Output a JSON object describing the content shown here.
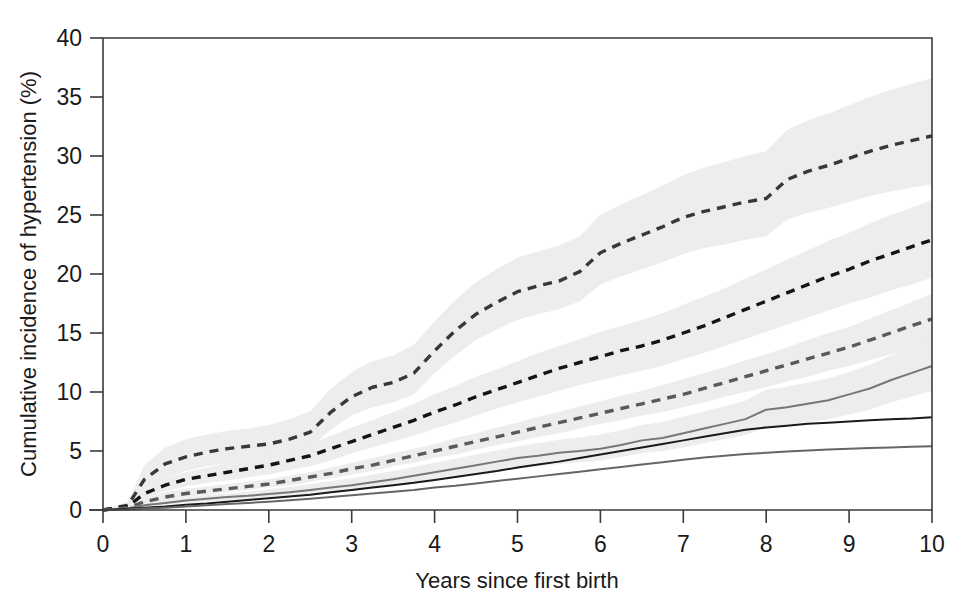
{
  "chart_data": {
    "type": "line",
    "title": "",
    "xlabel": "Years since first birth",
    "ylabel": "Cumulative incidence of hypertension (%)",
    "xlim": [
      0,
      10
    ],
    "ylim": [
      0,
      40
    ],
    "xticks": [
      0,
      1,
      2,
      3,
      4,
      5,
      6,
      7,
      8,
      9,
      10
    ],
    "xtick_labels": [
      "0",
      "1",
      "2",
      "3",
      "4",
      "5",
      "6",
      "7",
      "8",
      "9",
      "10"
    ],
    "yticks": [
      0,
      5,
      10,
      15,
      20,
      25,
      30,
      35,
      40
    ],
    "ytick_labels": [
      "0",
      "5",
      "10",
      "15",
      "20",
      "25",
      "30",
      "35",
      "40"
    ],
    "grid": false,
    "legend": "none",
    "band_color": "#ededed",
    "x": [
      0.0,
      0.3,
      0.5,
      0.75,
      1.0,
      1.25,
      1.5,
      1.75,
      2.0,
      2.25,
      2.5,
      2.75,
      3.0,
      3.25,
      3.5,
      3.75,
      4.0,
      4.25,
      4.5,
      4.75,
      5.0,
      5.25,
      5.5,
      5.75,
      6.0,
      6.25,
      6.5,
      6.75,
      7.0,
      7.25,
      7.5,
      7.75,
      8.0,
      8.25,
      8.5,
      8.75,
      9.0,
      9.25,
      9.5,
      9.75,
      10.0
    ],
    "series": [
      {
        "name": "curve-1-top-dashed",
        "style": "dashed",
        "color": "#383838",
        "values": [
          0.0,
          0.4,
          2.6,
          3.9,
          4.5,
          4.9,
          5.2,
          5.4,
          5.6,
          6.0,
          6.6,
          8.3,
          9.6,
          10.4,
          10.8,
          11.6,
          13.5,
          15.2,
          16.6,
          17.6,
          18.5,
          19.0,
          19.4,
          20.2,
          21.8,
          22.6,
          23.3,
          24.0,
          24.8,
          25.3,
          25.7,
          26.1,
          26.4,
          28.0,
          28.7,
          29.2,
          29.8,
          30.4,
          30.9,
          31.3,
          31.7
        ],
        "band_low": [
          0.0,
          0.2,
          1.6,
          2.7,
          3.3,
          3.7,
          4.0,
          4.2,
          4.4,
          4.8,
          5.3,
          6.8,
          8.0,
          8.7,
          9.1,
          9.8,
          11.6,
          13.1,
          14.4,
          15.3,
          16.1,
          16.6,
          17.0,
          17.7,
          19.1,
          19.8,
          20.4,
          21.0,
          21.7,
          22.2,
          22.5,
          22.9,
          23.2,
          24.6,
          25.2,
          25.6,
          26.1,
          26.6,
          27.0,
          27.3,
          27.6
        ],
        "band_high": [
          0.0,
          0.7,
          3.8,
          5.3,
          6.0,
          6.4,
          6.7,
          6.9,
          7.2,
          7.7,
          8.4,
          10.3,
          11.7,
          12.6,
          13.1,
          14.0,
          16.0,
          17.8,
          19.3,
          20.4,
          21.4,
          21.9,
          22.4,
          23.2,
          25.0,
          25.9,
          26.7,
          27.5,
          28.4,
          29.0,
          29.5,
          30.0,
          30.4,
          32.2,
          33.0,
          33.6,
          34.3,
          35.0,
          35.6,
          36.1,
          36.6
        ]
      },
      {
        "name": "curve-2-middle-dashed",
        "style": "dashed",
        "color": "#141414",
        "values": [
          0.0,
          0.3,
          1.4,
          2.1,
          2.6,
          2.9,
          3.2,
          3.5,
          3.8,
          4.2,
          4.6,
          5.2,
          5.8,
          6.4,
          7.0,
          7.6,
          8.3,
          8.9,
          9.6,
          10.2,
          10.8,
          11.4,
          12.0,
          12.5,
          13.0,
          13.5,
          13.9,
          14.4,
          15.0,
          15.6,
          16.3,
          17.0,
          17.7,
          18.4,
          19.1,
          19.8,
          20.4,
          21.1,
          21.7,
          22.3,
          22.9
        ],
        "band_low": [
          0.0,
          0.2,
          1.0,
          1.6,
          2.0,
          2.3,
          2.5,
          2.8,
          3.0,
          3.4,
          3.7,
          4.2,
          4.8,
          5.3,
          5.8,
          6.3,
          6.9,
          7.4,
          8.0,
          8.6,
          9.1,
          9.6,
          10.1,
          10.6,
          11.0,
          11.4,
          11.8,
          12.2,
          12.8,
          13.3,
          13.9,
          14.5,
          15.1,
          15.7,
          16.3,
          16.9,
          17.5,
          18.0,
          18.6,
          19.1,
          19.7
        ],
        "band_high": [
          0.0,
          0.5,
          1.9,
          2.7,
          3.2,
          3.6,
          4.0,
          4.3,
          4.7,
          5.1,
          5.6,
          6.3,
          7.0,
          7.6,
          8.3,
          9.0,
          9.8,
          10.5,
          11.3,
          11.9,
          12.6,
          13.3,
          13.9,
          14.5,
          15.1,
          15.6,
          16.1,
          16.7,
          17.4,
          18.1,
          18.8,
          19.6,
          20.4,
          21.2,
          22.0,
          22.8,
          23.5,
          24.3,
          25.0,
          25.6,
          26.3
        ]
      },
      {
        "name": "curve-3-lower-dashed",
        "style": "dashed",
        "color": "#5a5a5a",
        "values": [
          0.0,
          0.2,
          0.7,
          1.1,
          1.4,
          1.6,
          1.8,
          2.0,
          2.2,
          2.5,
          2.8,
          3.1,
          3.5,
          3.8,
          4.2,
          4.6,
          5.0,
          5.4,
          5.8,
          6.2,
          6.6,
          7.0,
          7.4,
          7.8,
          8.2,
          8.6,
          9.0,
          9.4,
          9.8,
          10.3,
          10.8,
          11.3,
          11.8,
          12.3,
          12.8,
          13.3,
          13.8,
          14.4,
          15.0,
          15.6,
          16.2
        ],
        "band_low": [
          0.0,
          0.1,
          0.5,
          0.8,
          1.1,
          1.3,
          1.5,
          1.7,
          1.9,
          2.1,
          2.4,
          2.7,
          3.0,
          3.3,
          3.7,
          4.0,
          4.4,
          4.7,
          5.1,
          5.5,
          5.8,
          6.2,
          6.5,
          6.9,
          7.3,
          7.6,
          8.0,
          8.3,
          8.7,
          9.1,
          9.6,
          10.0,
          10.4,
          10.9,
          11.3,
          11.8,
          12.2,
          12.7,
          13.2,
          13.7,
          14.2
        ],
        "band_high": [
          0.0,
          0.4,
          1.0,
          1.5,
          1.8,
          2.0,
          2.2,
          2.4,
          2.6,
          2.9,
          3.2,
          3.6,
          4.0,
          4.4,
          4.8,
          5.2,
          5.6,
          6.1,
          6.5,
          7.0,
          7.4,
          7.9,
          8.3,
          8.8,
          9.2,
          9.7,
          10.1,
          10.6,
          11.1,
          11.6,
          12.1,
          12.7,
          13.2,
          13.8,
          14.4,
          15.0,
          15.5,
          16.2,
          16.9,
          17.6,
          18.3
        ]
      },
      {
        "name": "curve-4-gray-solid",
        "style": "solid",
        "color": "#777777",
        "values": [
          0.0,
          0.15,
          0.4,
          0.6,
          0.8,
          0.95,
          1.1,
          1.2,
          1.35,
          1.5,
          1.7,
          1.9,
          2.1,
          2.35,
          2.6,
          2.9,
          3.2,
          3.5,
          3.8,
          4.1,
          4.4,
          4.6,
          4.85,
          5.0,
          5.2,
          5.5,
          5.9,
          6.1,
          6.5,
          6.9,
          7.3,
          7.7,
          8.5,
          8.7,
          9.0,
          9.3,
          9.8,
          10.3,
          11.0,
          11.6,
          12.2
        ],
        "band_low": [
          0.0,
          0.1,
          0.3,
          0.45,
          0.6,
          0.7,
          0.8,
          0.9,
          1.0,
          1.15,
          1.3,
          1.45,
          1.6,
          1.8,
          2.0,
          2.25,
          2.5,
          2.75,
          3.0,
          3.25,
          3.5,
          3.7,
          3.9,
          4.05,
          4.2,
          4.5,
          4.8,
          5.0,
          5.3,
          5.65,
          6.0,
          6.35,
          7.0,
          7.2,
          7.45,
          7.7,
          8.1,
          8.5,
          9.1,
          9.6,
          10.1
        ],
        "band_high": [
          0.0,
          0.25,
          0.55,
          0.8,
          1.05,
          1.25,
          1.4,
          1.55,
          1.75,
          1.95,
          2.2,
          2.45,
          2.7,
          3.0,
          3.3,
          3.65,
          4.0,
          4.35,
          4.7,
          5.05,
          5.4,
          5.65,
          5.95,
          6.15,
          6.4,
          6.75,
          7.2,
          7.45,
          7.9,
          8.35,
          8.8,
          9.25,
          10.2,
          10.45,
          10.8,
          11.15,
          11.7,
          12.3,
          13.1,
          13.8,
          14.5
        ]
      },
      {
        "name": "curve-5-black-solid",
        "style": "solid",
        "color": "#1a1a1a",
        "values": [
          0.0,
          0.1,
          0.2,
          0.3,
          0.45,
          0.55,
          0.7,
          0.85,
          1.0,
          1.15,
          1.3,
          1.5,
          1.7,
          1.9,
          2.1,
          2.3,
          2.55,
          2.8,
          3.05,
          3.3,
          3.6,
          3.85,
          4.1,
          4.4,
          4.7,
          5.0,
          5.3,
          5.6,
          5.9,
          6.2,
          6.5,
          6.8,
          7.0,
          7.15,
          7.3,
          7.4,
          7.5,
          7.6,
          7.7,
          7.75,
          7.85
        ],
        "band_low": null,
        "band_high": null
      },
      {
        "name": "curve-6-gray-solid-lowest",
        "style": "solid",
        "color": "#666666",
        "values": [
          0.0,
          0.05,
          0.12,
          0.2,
          0.3,
          0.4,
          0.5,
          0.6,
          0.7,
          0.82,
          0.95,
          1.1,
          1.25,
          1.4,
          1.55,
          1.7,
          1.9,
          2.05,
          2.25,
          2.45,
          2.65,
          2.85,
          3.05,
          3.25,
          3.45,
          3.65,
          3.85,
          4.05,
          4.25,
          4.45,
          4.6,
          4.75,
          4.85,
          4.95,
          5.05,
          5.12,
          5.2,
          5.25,
          5.3,
          5.35,
          5.4
        ],
        "band_low": null,
        "band_high": null
      }
    ]
  },
  "axes": {
    "y_title": "Cumulative incidence of hypertension (%)",
    "x_title": "Years since first birth"
  }
}
